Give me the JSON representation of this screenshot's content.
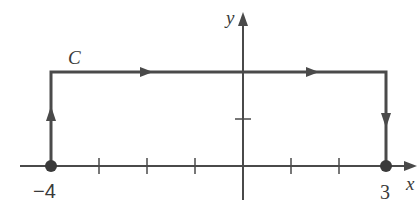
{
  "figure": {
    "curve_label": "C",
    "x_axis_label": "x",
    "y_axis_label": "y",
    "x_tick_labels": [
      {
        "value": -4,
        "text": "−4"
      },
      {
        "value": 3,
        "text": "3"
      }
    ],
    "path_vertices": [
      [
        -4,
        0
      ],
      [
        -4,
        2
      ],
      [
        3,
        2
      ],
      [
        3,
        0
      ]
    ],
    "direction": "counter... from (-4,0) up to (-4,2), right to (3,2), down to (3,0)",
    "endpoints": [
      [
        -4,
        0
      ],
      [
        3,
        0
      ]
    ],
    "x_ticks": [
      -4,
      -3,
      -2,
      -1,
      1,
      2,
      3
    ],
    "y_ticks": [
      1,
      2
    ],
    "colors": {
      "axis": "#4a4a4a",
      "curve": "#4a4a4a",
      "text": "#3a3a3a"
    }
  }
}
